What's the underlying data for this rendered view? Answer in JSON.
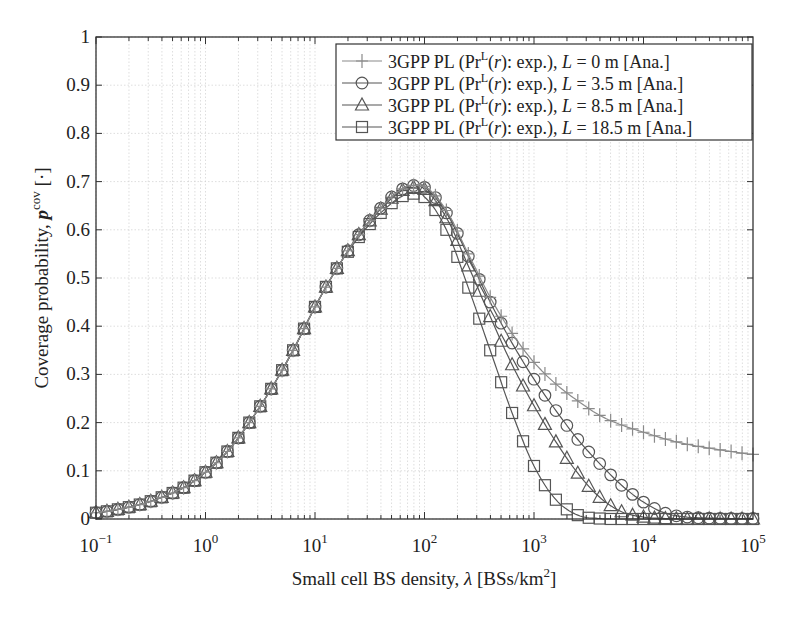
{
  "chart_data": {
    "type": "line",
    "title": "",
    "xlabel": "Small cell BS density, λ [BSs/km²]",
    "xlabel_parts": {
      "main": "Small cell BS density, ",
      "symbol": "λ",
      "rest": " [BSs/km",
      "sup": "2",
      "end": "]"
    },
    "ylabel": "Coverage probability, p^cov [·]",
    "ylabel_parts": {
      "main": "Coverage probability, ",
      "symbol": "p",
      "sup": "cov",
      "end": " [·]"
    },
    "xscale": "log",
    "xlim": [
      0.1,
      100000
    ],
    "ylim": [
      0,
      1
    ],
    "grid": true,
    "legend_position": "upper right",
    "x_ticks": [
      {
        "base": "10",
        "exp": "−1",
        "log": -1
      },
      {
        "base": "10",
        "exp": "0",
        "log": 0
      },
      {
        "base": "10",
        "exp": "1",
        "log": 1
      },
      {
        "base": "10",
        "exp": "2",
        "log": 2
      },
      {
        "base": "10",
        "exp": "3",
        "log": 3
      },
      {
        "base": "10",
        "exp": "4",
        "log": 4
      },
      {
        "base": "10",
        "exp": "5",
        "log": 5
      }
    ],
    "y_ticks": [
      "0",
      "0.1",
      "0.2",
      "0.3",
      "0.4",
      "0.5",
      "0.6",
      "0.7",
      "0.8",
      "0.9",
      "1"
    ],
    "x_log": [
      -1.0,
      -0.8,
      -0.6,
      -0.4,
      -0.2,
      0.0,
      0.2,
      0.4,
      0.6,
      0.8,
      1.0,
      1.2,
      1.4,
      1.6,
      1.8,
      1.9,
      2.0,
      2.2,
      2.4,
      2.6,
      2.8,
      3.0,
      3.2,
      3.4,
      3.6,
      3.8,
      4.0,
      4.2,
      4.4,
      4.6,
      4.8,
      5.0
    ],
    "series": [
      {
        "name": "3GPP PL (Pr^L(r): exp.), L = 0 m [Ana.]",
        "label_parts": {
          "pre": "3GPP PL (Pr",
          "sup": "L",
          "mid": "(",
          "r": "r",
          "mid2": "): exp.), ",
          "L": "L",
          "post": " = 0 m [Ana.]"
        },
        "marker": "plus",
        "color": "#8a8a8a",
        "values": [
          0.013,
          0.02,
          0.03,
          0.045,
          0.065,
          0.097,
          0.14,
          0.2,
          0.27,
          0.35,
          0.44,
          0.52,
          0.59,
          0.645,
          0.685,
          0.692,
          0.69,
          0.64,
          0.55,
          0.46,
          0.385,
          0.325,
          0.28,
          0.245,
          0.215,
          0.195,
          0.18,
          0.166,
          0.155,
          0.147,
          0.14,
          0.134
        ]
      },
      {
        "name": "3GPP PL (Pr^L(r): exp.), L = 3.5 m [Ana.]",
        "label_parts": {
          "pre": "3GPP PL (Pr",
          "sup": "L",
          "mid": "(",
          "r": "r",
          "mid2": "): exp.), ",
          "L": "L",
          "post": " = 3.5 m [Ana.]"
        },
        "marker": "circle",
        "color": "#555555",
        "values": [
          0.013,
          0.02,
          0.03,
          0.045,
          0.065,
          0.097,
          0.14,
          0.2,
          0.27,
          0.35,
          0.44,
          0.52,
          0.59,
          0.645,
          0.685,
          0.692,
          0.688,
          0.635,
          0.545,
          0.45,
          0.365,
          0.29,
          0.225,
          0.165,
          0.115,
          0.07,
          0.035,
          0.012,
          0.004,
          0.002,
          0.001,
          0.001
        ]
      },
      {
        "name": "3GPP PL (Pr^L(r): exp.), L = 8.5 m [Ana.]",
        "label_parts": {
          "pre": "3GPP PL (Pr",
          "sup": "L",
          "mid": "(",
          "r": "r",
          "mid2": "): exp.), ",
          "L": "L",
          "post": " = 8.5 m [Ana.]"
        },
        "marker": "triangle",
        "color": "#555555",
        "values": [
          0.013,
          0.02,
          0.03,
          0.045,
          0.065,
          0.097,
          0.14,
          0.2,
          0.27,
          0.35,
          0.44,
          0.52,
          0.59,
          0.643,
          0.682,
          0.688,
          0.684,
          0.625,
          0.525,
          0.42,
          0.32,
          0.235,
          0.16,
          0.095,
          0.045,
          0.015,
          0.004,
          0.001,
          0.0,
          0.0,
          0.0,
          0.0
        ]
      },
      {
        "name": "3GPP PL (Pr^L(r): exp.), L = 18.5 m [Ana.]",
        "label_parts": {
          "pre": "3GPP PL (Pr",
          "sup": "L",
          "mid": "(",
          "r": "r",
          "mid2": "): exp.), ",
          "L": "L",
          "post": " = 18.5 m [Ana.]"
        },
        "marker": "square",
        "color": "#555555",
        "values": [
          0.013,
          0.02,
          0.03,
          0.045,
          0.065,
          0.097,
          0.14,
          0.2,
          0.27,
          0.35,
          0.44,
          0.52,
          0.585,
          0.635,
          0.67,
          0.675,
          0.668,
          0.6,
          0.48,
          0.35,
          0.22,
          0.11,
          0.04,
          0.008,
          0.001,
          0.0,
          0.0,
          0.0,
          0.0,
          0.0,
          0.0,
          0.0
        ]
      }
    ]
  },
  "colors": {
    "axis": "#333333",
    "grid": "#d0d0d0",
    "line": "#444444",
    "light_series": "#8a8a8a"
  }
}
